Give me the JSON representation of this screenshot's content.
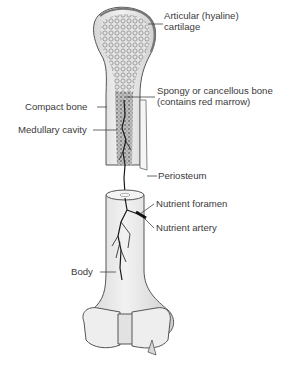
{
  "diagram": {
    "labels": {
      "articular_cartilage": {
        "line1": "Articular (hyaline)",
        "line2": "cartilage"
      },
      "spongy_bone": {
        "line1": "Spongy or cancellous bone",
        "line2": "(contains red marrow)"
      },
      "compact_bone": "Compact bone",
      "medullary_cavity": "Medullary cavity",
      "periosteum": "Periosteum",
      "nutrient_foramen": "Nutrient foramen",
      "nutrient_artery": "Nutrient artery",
      "body": "Body"
    },
    "colors": {
      "bone_fill": "#e9e9e9",
      "bone_shadow": "#cfcfcf",
      "outline": "#555555",
      "text": "#3a3a3a",
      "artery": "#1a1a1a"
    }
  }
}
